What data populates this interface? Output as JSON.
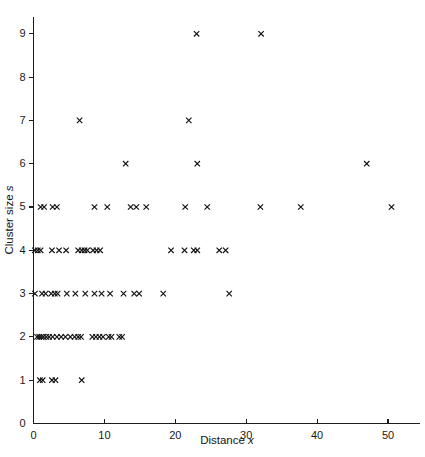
{
  "chart_data": {
    "type": "scatter",
    "title": "",
    "xlabel": "Distance x",
    "xlabel_text": "Distance",
    "xlabel_var": "x",
    "ylabel": "Cluster size s",
    "ylabel_text": "Cluster size",
    "ylabel_var": "s",
    "xlim": [
      0,
      53.5
    ],
    "ylim": [
      0,
      9.55
    ],
    "grid": false,
    "legend": null,
    "marker": "x",
    "marker_color": "#111111",
    "xticks": [
      0,
      10,
      20,
      30,
      40,
      50
    ],
    "xtick_labels": [
      "0",
      "10",
      "20",
      "30",
      "40",
      "50"
    ],
    "yticks": [
      0,
      1,
      2,
      3,
      4,
      5,
      6,
      7,
      8,
      9
    ],
    "ytick_labels": [
      "0",
      "1",
      "2",
      "3",
      "4",
      "5",
      "6",
      "7",
      "8",
      "9"
    ],
    "series": [
      {
        "name": "clusters",
        "points": [
          [
            0.9,
            1
          ],
          [
            1.3,
            1
          ],
          [
            2.6,
            1
          ],
          [
            3.1,
            1
          ],
          [
            6.8,
            1
          ],
          [
            0.5,
            2
          ],
          [
            0.8,
            2
          ],
          [
            1.1,
            2
          ],
          [
            1.4,
            2
          ],
          [
            1.8,
            2
          ],
          [
            2.2,
            2
          ],
          [
            2.7,
            2
          ],
          [
            3.3,
            2
          ],
          [
            3.9,
            2
          ],
          [
            4.5,
            2
          ],
          [
            5.2,
            2
          ],
          [
            5.8,
            2
          ],
          [
            6.3,
            2
          ],
          [
            6.7,
            2
          ],
          [
            8.3,
            2
          ],
          [
            8.8,
            2
          ],
          [
            9.3,
            2
          ],
          [
            9.8,
            2
          ],
          [
            10.6,
            2
          ],
          [
            11.0,
            2
          ],
          [
            12.1,
            2
          ],
          [
            12.5,
            2
          ],
          [
            0.2,
            3
          ],
          [
            1.2,
            3
          ],
          [
            1.7,
            3
          ],
          [
            2.5,
            3
          ],
          [
            3.0,
            3
          ],
          [
            3.4,
            3
          ],
          [
            4.7,
            3
          ],
          [
            5.9,
            3
          ],
          [
            7.3,
            3
          ],
          [
            8.6,
            3
          ],
          [
            9.6,
            3
          ],
          [
            10.8,
            3
          ],
          [
            12.7,
            3
          ],
          [
            14.2,
            3
          ],
          [
            14.9,
            3
          ],
          [
            18.3,
            3
          ],
          [
            27.6,
            3
          ],
          [
            0.2,
            4
          ],
          [
            0.6,
            4
          ],
          [
            1.0,
            4
          ],
          [
            2.6,
            4
          ],
          [
            3.6,
            4
          ],
          [
            4.6,
            4
          ],
          [
            6.3,
            4
          ],
          [
            6.8,
            4
          ],
          [
            7.2,
            4
          ],
          [
            7.6,
            4
          ],
          [
            8.4,
            4
          ],
          [
            8.9,
            4
          ],
          [
            9.4,
            4
          ],
          [
            19.4,
            4
          ],
          [
            21.3,
            4
          ],
          [
            22.6,
            4
          ],
          [
            23.1,
            4
          ],
          [
            26.2,
            4
          ],
          [
            27.1,
            4
          ],
          [
            1.0,
            5
          ],
          [
            1.5,
            5
          ],
          [
            2.7,
            5
          ],
          [
            3.3,
            5
          ],
          [
            8.6,
            5
          ],
          [
            10.4,
            5
          ],
          [
            13.7,
            5
          ],
          [
            14.5,
            5
          ],
          [
            15.9,
            5
          ],
          [
            21.4,
            5
          ],
          [
            24.5,
            5
          ],
          [
            32.0,
            5
          ],
          [
            37.7,
            5
          ],
          [
            50.5,
            5
          ],
          [
            13.0,
            6
          ],
          [
            23.1,
            6
          ],
          [
            47.0,
            6
          ],
          [
            6.5,
            7
          ],
          [
            21.9,
            7
          ],
          [
            23.0,
            9
          ],
          [
            32.1,
            9
          ]
        ]
      }
    ]
  },
  "figure": {
    "background_color": "#ffffff",
    "axis_color": "#1c1c1c"
  }
}
